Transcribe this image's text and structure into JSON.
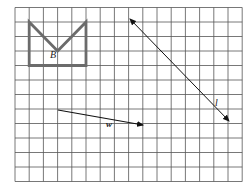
{
  "diagram": {
    "type": "grid-transformation",
    "grid": {
      "columns": 16,
      "rows": 12,
      "x0": 15,
      "y0": 7.5,
      "cell_w": 14.2,
      "cell_h": 14.5,
      "line_color": "#555555"
    },
    "shape": {
      "label": "B",
      "color": "#6b6b6b",
      "points_grid": [
        [
          1,
          1
        ],
        [
          3,
          3
        ],
        [
          5,
          1
        ],
        [
          5,
          4
        ],
        [
          1,
          4
        ]
      ]
    },
    "line": {
      "label": "l",
      "from": [
        130,
        19
      ],
      "to": [
        229,
        121
      ],
      "arrows": "both"
    },
    "vector": {
      "label": "w",
      "from": [
        58,
        110
      ],
      "to": [
        143,
        125
      ],
      "arrows": "end"
    }
  }
}
